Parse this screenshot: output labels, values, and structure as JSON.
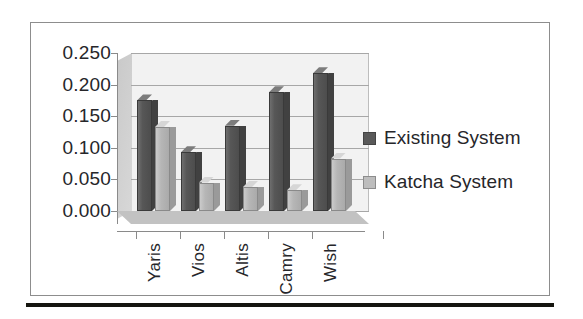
{
  "chart_data": {
    "type": "bar",
    "title": "",
    "xlabel": "",
    "ylabel": "",
    "categories": [
      "Yaris",
      "Vios",
      "Altis",
      "Camry",
      "Wish"
    ],
    "series": [
      {
        "name": "Existing System",
        "color": "#595959",
        "values": [
          0.175,
          0.093,
          0.135,
          0.188,
          0.218
        ]
      },
      {
        "name": "Katcha System",
        "color": "#bdbdbd",
        "values": [
          0.133,
          0.045,
          0.038,
          0.033,
          0.083
        ]
      }
    ],
    "ylim": [
      0.0,
      0.25
    ],
    "yticks": [
      "0.250",
      "0.200",
      "0.150",
      "0.100",
      "0.050",
      "0.000"
    ],
    "ytick_values": [
      0.25,
      0.2,
      0.15,
      0.1,
      0.05,
      0.0
    ],
    "grid": true,
    "legend_position": "right",
    "style": "3d-column"
  },
  "legend": {
    "items": [
      {
        "label": "Existing System",
        "swatch": "dark-swatch-icon"
      },
      {
        "label": "Katcha System",
        "swatch": "light-swatch-icon"
      }
    ]
  },
  "colors": {
    "series_existing": "#595959",
    "series_katcha": "#bdbdbd",
    "plot_background": "#f2f2f2",
    "gridline": "#a7a7a7",
    "frame_border": "#8d8d8d",
    "bottom_rule": "#15150f",
    "text": "#26262a"
  }
}
